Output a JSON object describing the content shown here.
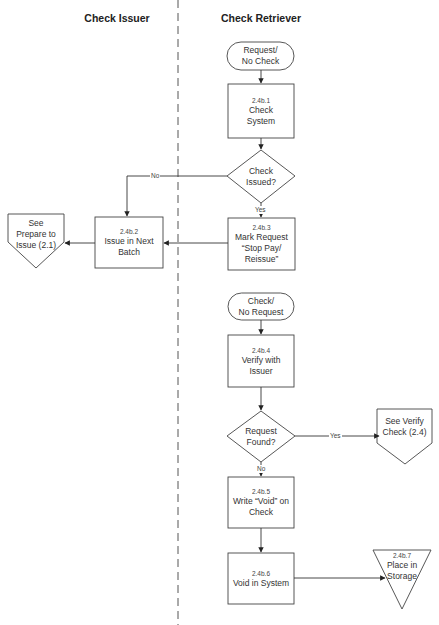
{
  "lanes": [
    {
      "title": "Check Issuer"
    },
    {
      "title": "Check Retriever"
    }
  ],
  "nodes": {
    "start1": {
      "type": "terminator",
      "label": "Request/\nNo Check",
      "line1": "Request/",
      "line2": "No Check"
    },
    "n1": {
      "type": "process",
      "id": "2.4b.1",
      "line1": "Check",
      "line2": "System"
    },
    "d1": {
      "type": "decision",
      "line1": "Check",
      "line2": "Issued?"
    },
    "n2": {
      "type": "process",
      "id": "2.4b.2",
      "line1": "Issue in Next",
      "line2": "Batch"
    },
    "n3": {
      "type": "process",
      "id": "2.4b.3",
      "line1": "Mark Request",
      "line2": "“Stop Pay/",
      "line3": "Reissue”"
    },
    "offpage1": {
      "type": "off-page-connector",
      "line1": "See",
      "line2": "Prepare to",
      "line3": "Issue (2.1)"
    },
    "start2": {
      "type": "terminator",
      "line1": "Check/",
      "line2": "No Request"
    },
    "n4": {
      "type": "process",
      "id": "2.4b.4",
      "line1": "Verify with",
      "line2": "Issuer"
    },
    "d2": {
      "type": "decision",
      "line1": "Request",
      "line2": "Found?"
    },
    "offpage2": {
      "type": "off-page-connector",
      "line1": "See Verify",
      "line2": "Check (2.4)"
    },
    "n5": {
      "type": "process",
      "id": "2.4b.5",
      "line1": "Write “Void” on",
      "line2": "Check"
    },
    "n6": {
      "type": "process",
      "id": "2.4b.6",
      "line1": "Void in System"
    },
    "n7": {
      "type": "storage",
      "id": "2.4b.7",
      "line1": "Place in",
      "line2": "Storage"
    }
  },
  "edges": [
    {
      "from": "start1",
      "to": "n1",
      "label": ""
    },
    {
      "from": "n1",
      "to": "d1",
      "label": ""
    },
    {
      "from": "d1",
      "to": "n2",
      "label": "No"
    },
    {
      "from": "d1",
      "to": "n3",
      "label": "Yes"
    },
    {
      "from": "n3",
      "to": "n2",
      "label": ""
    },
    {
      "from": "n2",
      "to": "offpage1",
      "label": ""
    },
    {
      "from": "start2",
      "to": "n4",
      "label": ""
    },
    {
      "from": "n4",
      "to": "d2",
      "label": ""
    },
    {
      "from": "d2",
      "to": "offpage2",
      "label": "Yes"
    },
    {
      "from": "d2",
      "to": "n5",
      "label": "No"
    },
    {
      "from": "n5",
      "to": "n6",
      "label": ""
    },
    {
      "from": "n6",
      "to": "n7",
      "label": ""
    }
  ],
  "labels": {
    "no": "No",
    "yes": "Yes"
  }
}
